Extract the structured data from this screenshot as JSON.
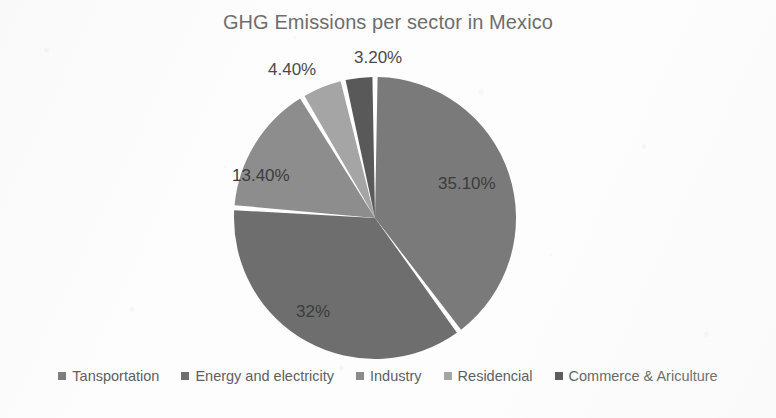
{
  "chart_data": {
    "type": "pie",
    "title": "GHG Emissions per sector in Mexico",
    "categories": [
      "Tansportation",
      "Energy and electricity",
      "Industry",
      "Residencial",
      "Commerce & Ariculture"
    ],
    "values": [
      35.1,
      32.0,
      13.4,
      4.4,
      3.2
    ],
    "data_labels": [
      "35.10%",
      "32%",
      "13.40%",
      "4.40%",
      "3.20%"
    ],
    "colors": [
      "#7a7a7a",
      "#6e6e6e",
      "#8d8d8d",
      "#a5a5a5",
      "#595959"
    ],
    "start_angle_deg": 0,
    "direction": "clockwise",
    "legend_position": "bottom",
    "grid": false,
    "xlabel": "",
    "ylabel": ""
  },
  "title": "GHG Emissions per sector in Mexico",
  "slices": [
    {
      "label": "Tansportation",
      "percent_text": "35.10%",
      "value": 35.1,
      "color": "#7a7a7a"
    },
    {
      "label": "Energy and electricity",
      "percent_text": "32%",
      "value": 32.0,
      "color": "#6e6e6e"
    },
    {
      "label": "Industry",
      "percent_text": "13.40%",
      "value": 13.4,
      "color": "#8d8d8d"
    },
    {
      "label": "Residencial",
      "percent_text": "4.40%",
      "value": 4.4,
      "color": "#a5a5a5"
    },
    {
      "label": "Commerce & Ariculture",
      "percent_text": "3.20%",
      "value": 3.2,
      "color": "#595959"
    }
  ],
  "legend": {
    "items": [
      {
        "label": "Tansportation",
        "color": "#7a7a7a"
      },
      {
        "label": "Energy and electricity",
        "color": "#6e6e6e"
      },
      {
        "label": "Industry",
        "color": "#8d8d8d"
      },
      {
        "label": "Residencial",
        "color": "#a5a5a5"
      },
      {
        "label": "Commerce & Ariculture",
        "color": "#595959"
      }
    ]
  }
}
